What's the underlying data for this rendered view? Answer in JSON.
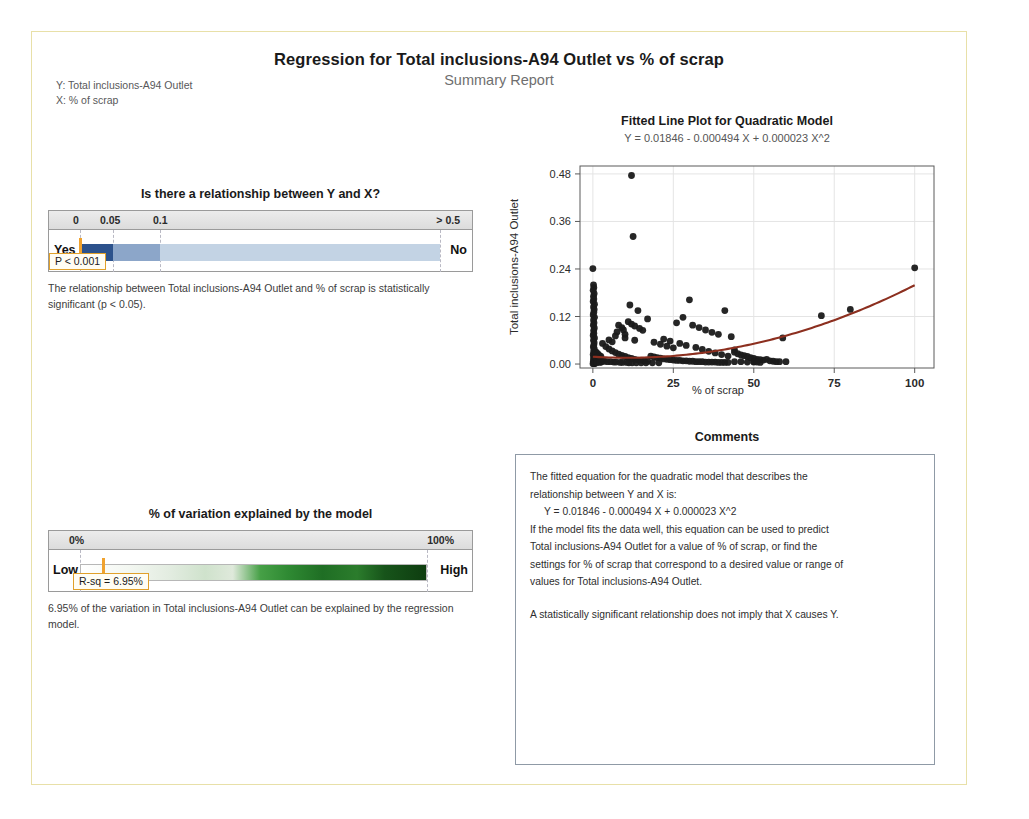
{
  "report": {
    "title": "Regression for Total inclusions-A94 Outlet vs % of scrap",
    "subtitle": "Summary Report",
    "y_label": "Y: Total inclusions-A94 Outlet",
    "x_label": "X: % of scrap"
  },
  "pvalue_panel": {
    "title": "Is there a relationship between Y and X?",
    "scale_labels": [
      "0",
      "0.05",
      "0.1",
      "> 0.5"
    ],
    "left_cap": "Yes",
    "right_cap": "No",
    "callout": "P < 0.001",
    "note": "The relationship between Total inclusions-A94 Outlet and % of scrap is statistically significant (p < 0.05).",
    "colors": {
      "dark": "#2c528c",
      "mid": "#8ca6c9",
      "light": "#c3d3e4",
      "marker": "#f0a22e"
    }
  },
  "rsq_panel": {
    "title": "% of variation explained by the model",
    "scale_labels": [
      "0%",
      "100%"
    ],
    "left_cap": "Low",
    "right_cap": "High",
    "callout": "R-sq = 6.95%",
    "note": "6.95% of the variation in Total inclusions-A94 Outlet can be explained by the regression model.",
    "marker_percent": 6.95,
    "colors": {
      "low": "#ffffff",
      "high": "#123d12",
      "marker": "#f0a22e"
    }
  },
  "comments_panel": {
    "title": "Comments",
    "line1": "The fitted equation for the quadratic model that describes the",
    "line2": "relationship between Y and X is:",
    "equation": "Y = 0.01846 - 0.000494 X + 0.000023 X^2",
    "line3": "If the model fits the data well, this equation can be used to predict",
    "line4": "Total inclusions-A94 Outlet for a value of % of scrap, or find the",
    "line5": "settings for % of scrap that correspond to a desired value or range of",
    "line6": "values for Total inclusions-A94 Outlet.",
    "line7": "A statistically significant relationship does not imply that X causes Y."
  },
  "chart_data": {
    "type": "scatter",
    "title": "Fitted Line Plot for Quadratic Model",
    "subtitle": "Y = 0.01846 - 0.000494 X + 0.000023 X^2",
    "xlabel": "% of scrap",
    "ylabel": "Total inclusions-A94 Outlet",
    "xlim": [
      -4,
      106
    ],
    "ylim": [
      -0.01,
      0.5
    ],
    "xticks": [
      0,
      25,
      50,
      75,
      100
    ],
    "yticks": [
      0.0,
      0.12,
      0.24,
      0.36,
      0.48
    ],
    "ytick_labels": [
      "0.00",
      "0.12",
      "0.24",
      "0.36",
      "0.48"
    ],
    "grid": true,
    "legend": false,
    "marker_color": "#1a1a1a",
    "fit_color": "#8c2f1f",
    "fit_equation": {
      "intercept": 0.01846,
      "linear": -0.000494,
      "quadratic": 2.3e-05
    },
    "points": [
      [
        0,
        0.241
      ],
      [
        0.2,
        0.2
      ],
      [
        0.3,
        0.193
      ],
      [
        0.1,
        0.186
      ],
      [
        0.4,
        0.178
      ],
      [
        0.2,
        0.171
      ],
      [
        0.3,
        0.164
      ],
      [
        0.1,
        0.158
      ],
      [
        0.5,
        0.151
      ],
      [
        0.2,
        0.144
      ],
      [
        0.4,
        0.138
      ],
      [
        0.3,
        0.131
      ],
      [
        0.1,
        0.124
      ],
      [
        0.5,
        0.118
      ],
      [
        0.2,
        0.111
      ],
      [
        0.35,
        0.104
      ],
      [
        0.15,
        0.098
      ],
      [
        0.45,
        0.091
      ],
      [
        0.25,
        0.085
      ],
      [
        0.3,
        0.078
      ],
      [
        0.1,
        0.072
      ],
      [
        0.5,
        0.066
      ],
      [
        0.2,
        0.06
      ],
      [
        0.4,
        0.054
      ],
      [
        0.3,
        0.048
      ],
      [
        0.15,
        0.043
      ],
      [
        0.45,
        0.038
      ],
      [
        0.25,
        0.033
      ],
      [
        0.35,
        0.028
      ],
      [
        0.1,
        0.024
      ],
      [
        0.5,
        0.02
      ],
      [
        0.2,
        0.016
      ],
      [
        0.4,
        0.013
      ],
      [
        0.3,
        0.01
      ],
      [
        0.15,
        0.007
      ],
      [
        0.45,
        0.005
      ],
      [
        0.25,
        0.003
      ],
      [
        0.35,
        0.002
      ],
      [
        0.05,
        0.001
      ],
      [
        0.55,
        0.001
      ],
      [
        12,
        0.476
      ],
      [
        12.5,
        0.322
      ],
      [
        11.5,
        0.149
      ],
      [
        14,
        0.135
      ],
      [
        17,
        0.114
      ],
      [
        8,
        0.098
      ],
      [
        9,
        0.092
      ],
      [
        9.5,
        0.086
      ],
      [
        7.5,
        0.081
      ],
      [
        10,
        0.075
      ],
      [
        11,
        0.107
      ],
      [
        12,
        0.101
      ],
      [
        13,
        0.096
      ],
      [
        14.5,
        0.09
      ],
      [
        15.5,
        0.085
      ],
      [
        30,
        0.162
      ],
      [
        28,
        0.118
      ],
      [
        26,
        0.104
      ],
      [
        31,
        0.098
      ],
      [
        33,
        0.092
      ],
      [
        35,
        0.086
      ],
      [
        37,
        0.08
      ],
      [
        39,
        0.075
      ],
      [
        41,
        0.135
      ],
      [
        43,
        0.069
      ],
      [
        22,
        0.063
      ],
      [
        24,
        0.058
      ],
      [
        27,
        0.052
      ],
      [
        29,
        0.047
      ],
      [
        32,
        0.042
      ],
      [
        34,
        0.037
      ],
      [
        36,
        0.032
      ],
      [
        38,
        0.028
      ],
      [
        40,
        0.024
      ],
      [
        42,
        0.02
      ],
      [
        3,
        0.052
      ],
      [
        4,
        0.044
      ],
      [
        5,
        0.038
      ],
      [
        6,
        0.033
      ],
      [
        7,
        0.029
      ],
      [
        8,
        0.025
      ],
      [
        9,
        0.022
      ],
      [
        10,
        0.019
      ],
      [
        11,
        0.016
      ],
      [
        12,
        0.014
      ],
      [
        13,
        0.012
      ],
      [
        14,
        0.01
      ],
      [
        15,
        0.009
      ],
      [
        16,
        0.008
      ],
      [
        17,
        0.007
      ],
      [
        18,
        0.02
      ],
      [
        19,
        0.018
      ],
      [
        20,
        0.016
      ],
      [
        21,
        0.015
      ],
      [
        22,
        0.013
      ],
      [
        23,
        0.012
      ],
      [
        24,
        0.011
      ],
      [
        25,
        0.01
      ],
      [
        26,
        0.009
      ],
      [
        27,
        0.009
      ],
      [
        28,
        0.008
      ],
      [
        29,
        0.008
      ],
      [
        30,
        0.007
      ],
      [
        31,
        0.007
      ],
      [
        32,
        0.006
      ],
      [
        33,
        0.006
      ],
      [
        34,
        0.006
      ],
      [
        35,
        0.005
      ],
      [
        36,
        0.005
      ],
      [
        37,
        0.005
      ],
      [
        38,
        0.005
      ],
      [
        39,
        0.004
      ],
      [
        40,
        0.004
      ],
      [
        41,
        0.004
      ],
      [
        42,
        0.004
      ],
      [
        44,
        0.03
      ],
      [
        45,
        0.026
      ],
      [
        46,
        0.023
      ],
      [
        47,
        0.021
      ],
      [
        48,
        0.019
      ],
      [
        49,
        0.016
      ],
      [
        50,
        0.014
      ],
      [
        51,
        0.012
      ],
      [
        52,
        0.011
      ],
      [
        53,
        0.01
      ],
      [
        44,
        0.006
      ],
      [
        46,
        0.006
      ],
      [
        48,
        0.005
      ],
      [
        50,
        0.005
      ],
      [
        52,
        0.004
      ],
      [
        54,
        0.012
      ],
      [
        55,
        0.008
      ],
      [
        56,
        0.007
      ],
      [
        57,
        0.006
      ],
      [
        58,
        0.006
      ],
      [
        50,
        0.006
      ],
      [
        51,
        0.005
      ],
      [
        60,
        0.006
      ],
      [
        59,
        0.066
      ],
      [
        71,
        0.122
      ],
      [
        80,
        0.138
      ],
      [
        100,
        0.243
      ],
      [
        1,
        0.03
      ],
      [
        1.5,
        0.026
      ],
      [
        2,
        0.022
      ],
      [
        2.5,
        0.019
      ],
      [
        1.2,
        0.016
      ],
      [
        1.8,
        0.013
      ],
      [
        2.2,
        0.011
      ],
      [
        1.4,
        0.009
      ],
      [
        2.8,
        0.008
      ],
      [
        1.6,
        0.007
      ],
      [
        2.4,
        0.006
      ],
      [
        1.1,
        0.005
      ],
      [
        2.6,
        0.005
      ],
      [
        1.3,
        0.004
      ],
      [
        2.1,
        0.004
      ],
      [
        3.5,
        0.007
      ],
      [
        4.5,
        0.006
      ],
      [
        5.5,
        0.006
      ],
      [
        6.5,
        0.005
      ],
      [
        7.2,
        0.005
      ],
      [
        8.5,
        0.004
      ],
      [
        9.2,
        0.004
      ],
      [
        10.5,
        0.004
      ],
      [
        11.2,
        0.003
      ],
      [
        12.2,
        0.003
      ],
      [
        13.5,
        0.003
      ],
      [
        15,
        0.003
      ],
      [
        16.5,
        0.003
      ],
      [
        18.5,
        0.003
      ],
      [
        20.5,
        0.003
      ],
      [
        5,
        0.061
      ],
      [
        6,
        0.056
      ],
      [
        7,
        0.071
      ],
      [
        10,
        0.066
      ],
      [
        13,
        0.06
      ],
      [
        19,
        0.055
      ],
      [
        21,
        0.05
      ],
      [
        23,
        0.045
      ],
      [
        25,
        0.041
      ],
      [
        44,
        0.036
      ]
    ]
  }
}
